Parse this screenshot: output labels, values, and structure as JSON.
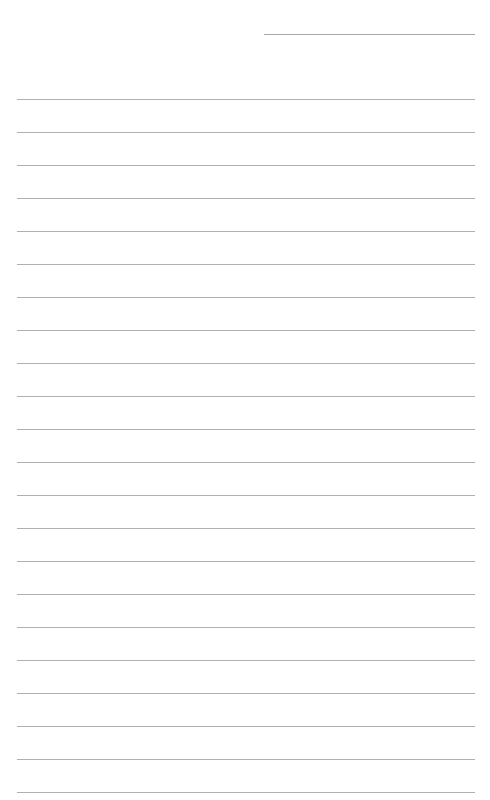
{
  "page": {
    "type": "lined-paper",
    "header_line": {
      "label": ""
    },
    "ruled_line_count": 22,
    "line_color": "#b0b0b0",
    "background_color": "#ffffff"
  }
}
